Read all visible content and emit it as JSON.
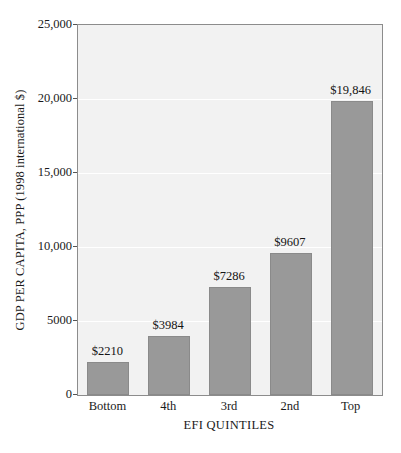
{
  "chart_data": {
    "type": "bar",
    "title": "",
    "xlabel": "EFI QUINTILES",
    "ylabel": "GDP PER CAPITA, PPP (1998 international $)",
    "categories": [
      "Bottom",
      "4th",
      "3rd",
      "2nd",
      "Top"
    ],
    "values": [
      2210,
      3984,
      7286,
      9607,
      19846
    ],
    "data_labels": [
      "$2210",
      "$3984",
      "$7286",
      "$9607",
      "$19,846"
    ],
    "ylim": [
      0,
      25000
    ],
    "ytick_values": [
      0,
      5000,
      10000,
      15000,
      20000,
      25000
    ],
    "ytick_labels": [
      "0",
      "5000",
      "10,000",
      "15,000",
      "20,000",
      "25,000"
    ],
    "grid": "horizontal",
    "legend": "none",
    "colors": {
      "bar_fill": "#999999",
      "bar_border": "#8a8a8a",
      "plot_background": "#f2f2f2",
      "plot_border": "#8c8c8c",
      "gridline": "#ffffff",
      "page_background": "#ffffff",
      "text": "#1a1a1a"
    }
  }
}
